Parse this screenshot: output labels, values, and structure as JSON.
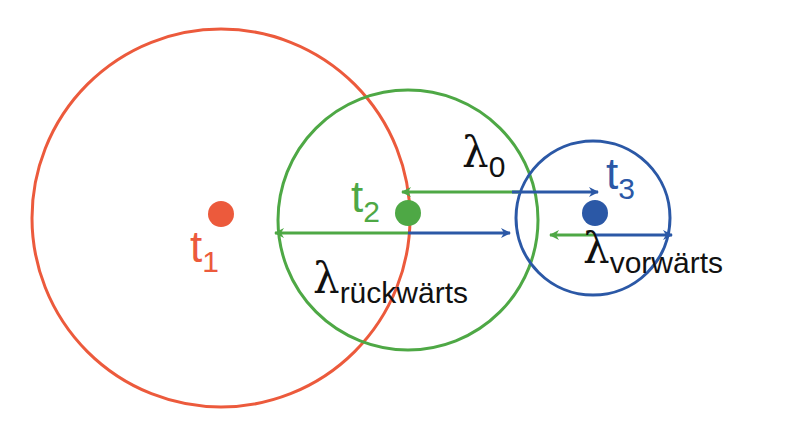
{
  "colors": {
    "red": "#ec5a3c",
    "green": "#4ea845",
    "blue": "#2b58a6",
    "text": "#111111"
  },
  "points": [
    {
      "name": "t",
      "sub": "1",
      "color": "red"
    },
    {
      "name": "t",
      "sub": "2",
      "color": "green"
    },
    {
      "name": "t",
      "sub": "3",
      "color": "blue"
    }
  ],
  "labels": {
    "lambda": "λ",
    "lambda0_sub": "0",
    "backward_sub": "rückwärts",
    "forward_sub": "vorwärts"
  }
}
